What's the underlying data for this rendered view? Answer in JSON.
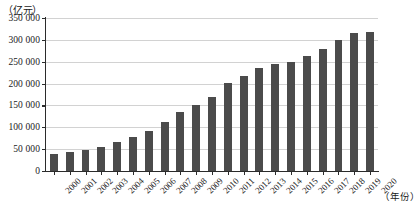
{
  "chart_data": {
    "type": "bar",
    "title": "",
    "subtitle": "",
    "xlabel": "（年份）",
    "ylabel": "（亿元）",
    "ylim": [
      0,
      350000
    ],
    "ytick_step": 50000,
    "grid": true,
    "legend": null,
    "bar_color": "#4b4b4b",
    "ytick_labels": [
      "350 000",
      "300 000",
      "250 000",
      "200 000",
      "150 000",
      "100 000",
      "50 000",
      "0"
    ],
    "ytick_values": [
      350000,
      300000,
      250000,
      200000,
      150000,
      100000,
      50000,
      0
    ],
    "categories": [
      "2000",
      "2001",
      "2002",
      "2003",
      "2004",
      "2005",
      "2006",
      "2007",
      "2008",
      "2009",
      "2010",
      "2011",
      "2012",
      "2013",
      "2014",
      "2015",
      "2016",
      "2017",
      "2018",
      "2019",
      "2020"
    ],
    "values": [
      40000,
      44000,
      48000,
      55000,
      66000,
      78000,
      92000,
      113000,
      136000,
      150000,
      170000,
      202000,
      217000,
      235000,
      245000,
      250000,
      263000,
      280000,
      300000,
      315000,
      318000
    ]
  },
  "axes": {
    "y_unit_caption": "（亿元）",
    "x_unit_caption": "（年份）"
  }
}
